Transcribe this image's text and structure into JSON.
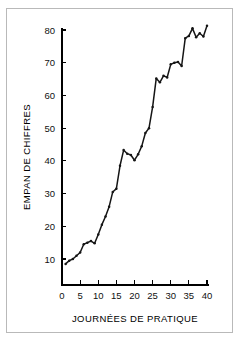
{
  "figure": {
    "background_color": "#ffffff",
    "border_color": "#b9b9b9",
    "line_color": "#151515"
  },
  "chart_data": {
    "type": "line",
    "title": "",
    "subtitle": "",
    "xlabel": "JOURNÉES DE PRATIQUE",
    "ylabel": "EMPAN DE CHIFFRES",
    "xlim": [
      0,
      41
    ],
    "ylim": [
      5,
      84
    ],
    "xticks": [
      0,
      5,
      10,
      15,
      20,
      25,
      30,
      35,
      40
    ],
    "xtick_labels": [
      "0",
      "5",
      "10",
      "15",
      "20",
      "25",
      "30",
      "35",
      "40"
    ],
    "yticks": [
      10,
      20,
      30,
      40,
      50,
      60,
      70,
      80
    ],
    "ytick_labels": [
      "10",
      "20",
      "30",
      "40",
      "50",
      "60",
      "70",
      "80"
    ],
    "grid": false,
    "legend": false,
    "legend_position": "none",
    "markers": true,
    "x": [
      1,
      2,
      3,
      4,
      5,
      6,
      7,
      8,
      9,
      10,
      11,
      12,
      13,
      14,
      15,
      16,
      17,
      18,
      19,
      20,
      21,
      22,
      23,
      24,
      25,
      26,
      27,
      28,
      29,
      30,
      31,
      32,
      33,
      34,
      35,
      36,
      37,
      38,
      39,
      40
    ],
    "y": [
      8.5,
      9.5,
      10.0,
      11.0,
      12.0,
      14.5,
      15.0,
      15.5,
      14.8,
      17.5,
      20.5,
      23.0,
      26.0,
      30.5,
      31.5,
      38.5,
      43.3,
      42.2,
      41.8,
      40.2,
      42.0,
      44.5,
      48.5,
      50.0,
      56.5,
      65.2,
      64.0,
      66.0,
      65.5,
      69.5,
      70.0,
      70.2,
      69.0,
      77.5,
      78.2,
      80.5,
      77.8,
      79.0,
      78.0,
      81.3
    ],
    "series": [
      {
        "name": "empan de chiffres",
        "values": [
          8.5,
          9.5,
          10.0,
          11.0,
          12.0,
          14.5,
          15.0,
          15.5,
          14.8,
          17.5,
          20.5,
          23.0,
          26.0,
          30.5,
          31.5,
          38.5,
          43.3,
          42.2,
          41.8,
          40.2,
          42.0,
          44.5,
          48.5,
          50.0,
          56.5,
          65.2,
          64.0,
          66.0,
          65.5,
          69.5,
          70.0,
          70.2,
          69.0,
          77.5,
          78.2,
          80.5,
          77.8,
          79.0,
          78.0,
          81.3
        ]
      }
    ]
  }
}
